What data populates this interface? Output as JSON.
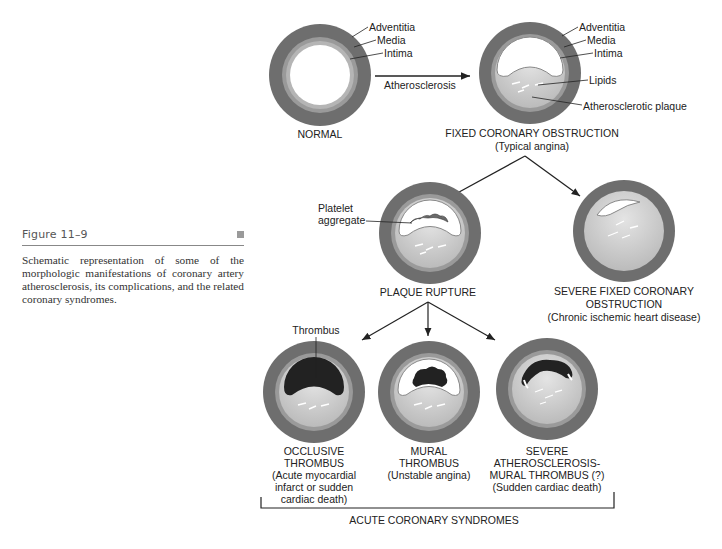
{
  "figure": {
    "title": "Figure 11–9",
    "caption": "Schematic representation of some of the morphologic manifestations of coronary artery atherosclerosis, its complications, and the related coronary syndromes."
  },
  "layer_labels": {
    "adventitia": "Adventitia",
    "media": "Media",
    "intima": "Intima",
    "lipids": "Lipids",
    "plaque": "Atherosclerotic plaque",
    "platelet_line1": "Platelet",
    "platelet_line2": "aggregate",
    "thrombus": "Thrombus"
  },
  "arrows": {
    "atherosclerosis": "Atherosclerosis"
  },
  "stages": {
    "normal": {
      "title": "NORMAL"
    },
    "fixed": {
      "title": "FIXED CORONARY OBSTRUCTION",
      "subtitle": "(Typical angina)"
    },
    "rupture": {
      "title": "PLAQUE RUPTURE"
    },
    "severe_fixed": {
      "line1": "SEVERE FIXED CORONARY",
      "line2": "OBSTRUCTION",
      "subtitle": "(Chronic ischemic heart disease)"
    },
    "occlusive": {
      "line1": "OCCLUSIVE",
      "line2": "THROMBUS",
      "line3": "(Acute myocardial",
      "line4": "infarct or sudden",
      "line5": "cardiac death)"
    },
    "mural": {
      "line1": "MURAL",
      "line2": "THROMBUS",
      "line3": "(Unstable angina)"
    },
    "severe_mural": {
      "line1": "SEVERE",
      "line2": "ATHEROSCLEROSIS-",
      "line3": "MURAL THROMBUS (?)",
      "line4": "(Sudden cardiac death)"
    }
  },
  "group_label": "ACUTE CORONARY SYNDROMES",
  "colors": {
    "adventitia": "#6e6e6e",
    "media": "#9a9a9a",
    "intima": "#b9b9b9",
    "plaque": "#cfcfcf",
    "thrombus": "#222222",
    "lumen": "#ffffff"
  }
}
